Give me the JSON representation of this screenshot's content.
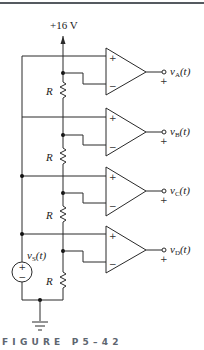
{
  "supply": {
    "label": "+16 V"
  },
  "resistor_label": "R",
  "source": {
    "label_main": "v",
    "label_sub": "S",
    "label_arg": "(t)",
    "plus": "+",
    "minus": "−"
  },
  "opamps": [
    {
      "id": "A",
      "out_main": "v",
      "out_sub": "A",
      "out_arg": "(t)",
      "plus": "+",
      "minus": "−",
      "out_plus": "+"
    },
    {
      "id": "B",
      "out_main": "v",
      "out_sub": "B",
      "out_arg": "(t)",
      "plus": "+",
      "minus": "−",
      "out_plus": "+"
    },
    {
      "id": "C",
      "out_main": "v",
      "out_sub": "C",
      "out_arg": "(t)",
      "plus": "+",
      "minus": "−",
      "out_plus": "+"
    },
    {
      "id": "D",
      "out_main": "v",
      "out_sub": "D",
      "out_arg": "(t)",
      "plus": "+",
      "minus": "−",
      "out_plus": "+"
    }
  ],
  "caption": "FIGURE P5–42",
  "colors": {
    "caption": "#5d6670",
    "wire": "#2a2a2a"
  }
}
